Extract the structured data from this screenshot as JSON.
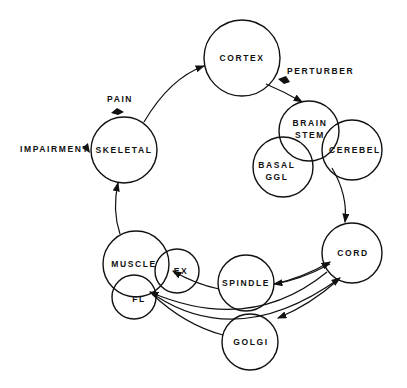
{
  "diagram": {
    "nodes": [
      {
        "id": "cortex",
        "label": "CORTEX",
        "cx": 242,
        "cy": 58,
        "r": 38
      },
      {
        "id": "brainstem",
        "label1": "BRAIN",
        "label2": "STEM",
        "cx": 309,
        "cy": 131,
        "r": 30
      },
      {
        "id": "cerebel",
        "label": "CEREBEL",
        "cx": 352,
        "cy": 150,
        "r": 30
      },
      {
        "id": "basal",
        "label1": "BASAL",
        "label2": "GGL",
        "cx": 283,
        "cy": 167,
        "r": 30
      },
      {
        "id": "skeletal",
        "label": "SKELETAL",
        "cx": 124,
        "cy": 150,
        "r": 33
      },
      {
        "id": "cord",
        "label": "CORD",
        "cx": 352,
        "cy": 253,
        "r": 30
      },
      {
        "id": "spindle",
        "label": "SPINDLE",
        "cx": 246,
        "cy": 283,
        "r": 28
      },
      {
        "id": "muscle",
        "label": "MUSCLE",
        "cx": 136,
        "cy": 264,
        "r": 33
      },
      {
        "id": "ex",
        "label": "EX",
        "cx": 177,
        "cy": 271,
        "r": 22
      },
      {
        "id": "fl",
        "label": "FL",
        "cx": 134,
        "cy": 297,
        "r": 22
      },
      {
        "id": "golgi",
        "label": "GOLGI",
        "cx": 250,
        "cy": 342,
        "r": 28
      }
    ],
    "annotations": [
      {
        "id": "perturber",
        "label": "PERTURBER"
      },
      {
        "id": "pain",
        "label": "PAIN"
      },
      {
        "id": "impairment",
        "label": "IMPAIRMENT"
      }
    ]
  }
}
